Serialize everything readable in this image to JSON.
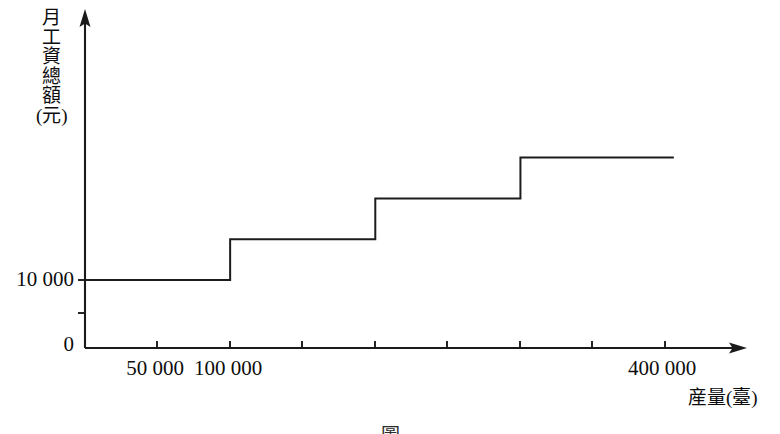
{
  "figure": {
    "caption": "圖",
    "background_color": "#ffffff",
    "line_color": "#1c1c1c"
  },
  "axes": {
    "y": {
      "title": "月工資總額(元)",
      "title_chars": [
        "月",
        "工",
        "資",
        "總",
        "額",
        "(元)"
      ],
      "tick_labels": [
        "10 000",
        "0"
      ]
    },
    "x": {
      "title": "産量(臺)",
      "tick_labels": [
        "50 000",
        "100 000",
        "400 000"
      ]
    }
  },
  "chart_data": {
    "type": "line",
    "subtype": "step",
    "title": "",
    "xlabel": "産量(臺)",
    "ylabel": "月工資總額(元)",
    "xlim": [
      0,
      450000
    ],
    "ylim": [
      0,
      32000
    ],
    "grid": false,
    "legend": null,
    "x_ticks": [
      50000,
      100000,
      150000,
      200000,
      250000,
      300000,
      350000,
      400000
    ],
    "x_tick_labels": [
      "50 000",
      "100 000",
      "",
      "",
      "",
      "",
      "",
      "400 000"
    ],
    "y_ticks": [
      0,
      5000,
      10000
    ],
    "y_tick_labels": [
      "0",
      "",
      "10 000"
    ],
    "series": [
      {
        "name": "月工資總額",
        "steps": [
          {
            "x_start": 0,
            "x_end": 100000,
            "y": 10000
          },
          {
            "x_start": 100000,
            "x_end": 200000,
            "y": 16000
          },
          {
            "x_start": 200000,
            "x_end": 300000,
            "y": 22000
          },
          {
            "x_start": 300000,
            "x_end": 405000,
            "y": 28000
          }
        ],
        "x": [
          0,
          100000,
          100000,
          200000,
          200000,
          300000,
          300000,
          405000
        ],
        "values": [
          10000,
          10000,
          16000,
          16000,
          22000,
          22000,
          28000,
          28000
        ]
      }
    ]
  }
}
